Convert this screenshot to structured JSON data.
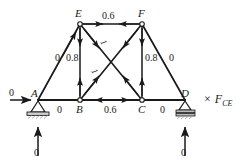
{
  "figure": {
    "type": "truss-influence-diagram",
    "scale_factor": {
      "times_symbol": "×",
      "variable": "F",
      "subscript": "CE"
    }
  },
  "nodes": [
    {
      "id": "A",
      "label": "A",
      "x": 38,
      "y": 100,
      "support": "pin"
    },
    {
      "id": "B",
      "label": "B",
      "x": 80,
      "y": 100,
      "support": "none"
    },
    {
      "id": "C",
      "label": "C",
      "x": 142,
      "y": 100,
      "support": "none"
    },
    {
      "id": "D",
      "label": "D",
      "x": 185,
      "y": 100,
      "support": "roller"
    },
    {
      "id": "E",
      "label": "E",
      "x": 80,
      "y": 24,
      "support": "none"
    },
    {
      "id": "F",
      "label": "F",
      "x": 142,
      "y": 24,
      "support": "none"
    }
  ],
  "members": [
    {
      "id": "AE",
      "from": "A",
      "to": "E",
      "force": "0",
      "arrows": "inward"
    },
    {
      "id": "AB",
      "from": "A",
      "to": "B",
      "force": "0",
      "arrows": "none"
    },
    {
      "id": "EB",
      "from": "E",
      "to": "B",
      "force": "0.8",
      "arrows": "inward"
    },
    {
      "id": "EF",
      "from": "E",
      "to": "F",
      "force": "0.6",
      "arrows": "inward"
    },
    {
      "id": "EC",
      "from": "E",
      "to": "C",
      "force": "1",
      "arrows": "inward"
    },
    {
      "id": "BF",
      "from": "B",
      "to": "F",
      "force": "1",
      "arrows": "inward"
    },
    {
      "id": "BC",
      "from": "B",
      "to": "C",
      "force": "0.6",
      "arrows": "outward"
    },
    {
      "id": "FC",
      "from": "F",
      "to": "C",
      "force": "0.8",
      "arrows": "inward"
    },
    {
      "id": "CD",
      "from": "C",
      "to": "D",
      "force": "0",
      "arrows": "none"
    },
    {
      "id": "FD",
      "from": "F",
      "to": "D",
      "force": "0",
      "arrows": "none"
    }
  ],
  "loads": {
    "horizontal_at_A": {
      "value": "0",
      "direction": "right"
    },
    "reaction_left": {
      "value": "0",
      "direction": "up"
    },
    "reaction_right": {
      "value": "0",
      "direction": "up"
    }
  },
  "member_labels": {
    "AE": "0",
    "EB": "0.8",
    "EF": "0.6",
    "EC": "1",
    "BF": "1",
    "FC": "0.8",
    "FD": "0",
    "AB": "0",
    "BC": "0.6",
    "CD": "0"
  },
  "node_labels": {
    "A": "A",
    "B": "B",
    "C": "C",
    "D": "D",
    "E": "E",
    "F": "F"
  },
  "colors": {
    "line": "#1a1a1a",
    "text": "#1a1a1a",
    "background": "#ffffff",
    "support_hatch": "#b5b5b5"
  }
}
